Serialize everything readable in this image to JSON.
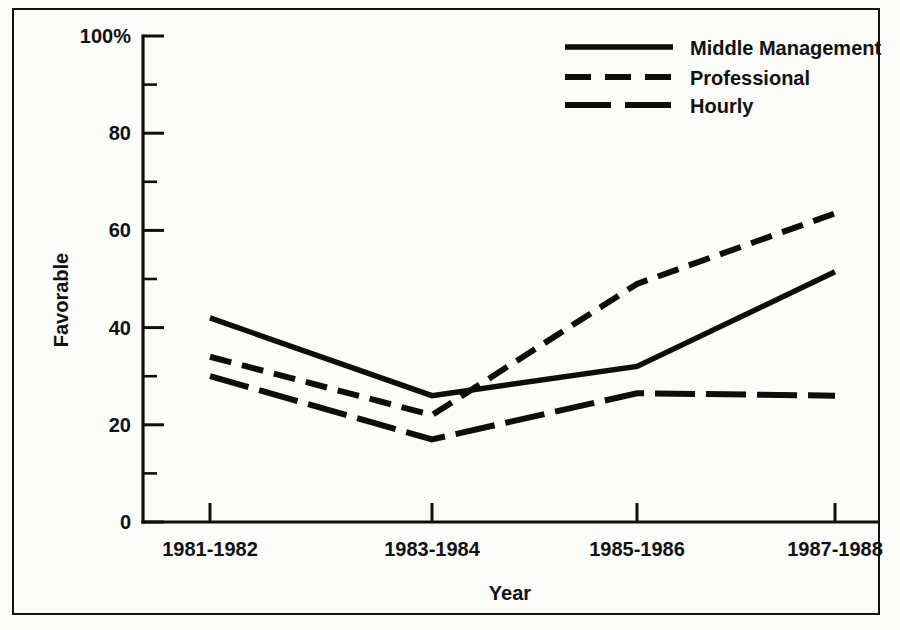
{
  "chart_data": {
    "type": "line",
    "title": "",
    "xlabel": "Year",
    "ylabel": "Favorable",
    "categories": [
      "1981-1982",
      "1983-1984",
      "1985-1986",
      "1987-1988"
    ],
    "ylim": [
      0,
      100
    ],
    "xlim_categories": 4,
    "grid": false,
    "legend_position": "top-right",
    "y_ticks_major": [
      0,
      20,
      40,
      60,
      80,
      100
    ],
    "y_tick_labels": [
      "0",
      "20",
      "40",
      "60",
      "80",
      "100%"
    ],
    "y_ticks_minor": [
      10,
      30,
      50,
      70,
      90
    ],
    "series": [
      {
        "name": "Middle Management",
        "style": "solid",
        "values": [
          42,
          26,
          32,
          51.5
        ]
      },
      {
        "name": "Professional",
        "style": "short-dash",
        "values": [
          34,
          22,
          49,
          63.5
        ]
      },
      {
        "name": "Hourly",
        "style": "long-dash",
        "values": [
          30,
          17,
          26.5,
          26
        ]
      }
    ]
  },
  "legend": {
    "items": [
      {
        "label": "Middle Management",
        "swatch": "solid-line-icon"
      },
      {
        "label": "Professional",
        "swatch": "short-dashed-line-icon"
      },
      {
        "label": "Hourly",
        "swatch": "long-dashed-line-icon"
      }
    ]
  },
  "colors": {
    "ink": "#0d0d0a",
    "paper": "#fcfcfb",
    "frame": "#14140f"
  }
}
